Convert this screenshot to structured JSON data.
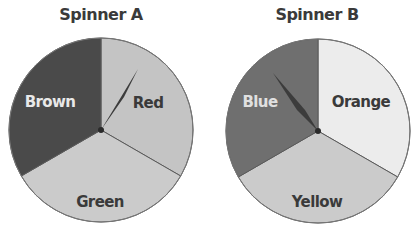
{
  "spinners": [
    {
      "title": "Spinner A",
      "sections": [
        {
          "label": "Red",
          "color": "#c2c2c2",
          "text_color": "#3a3a3a"
        },
        {
          "label": "Green",
          "color": "#c9c9c9",
          "text_color": "#3a3a3a"
        },
        {
          "label": "Brown",
          "color": "#4a4a4a",
          "text_color": "#e8e8e8"
        }
      ],
      "pointer": "Red"
    },
    {
      "title": "Spinner B",
      "sections": [
        {
          "label": "Orange",
          "color": "#ececec",
          "text_color": "#3a3a3a"
        },
        {
          "label": "Yellow",
          "color": "#c9c9c9",
          "text_color": "#3a3a3a"
        },
        {
          "label": "Blue",
          "color": "#6e6e6e",
          "text_color": "#e0e0e0"
        }
      ],
      "pointer": "Blue"
    }
  ]
}
